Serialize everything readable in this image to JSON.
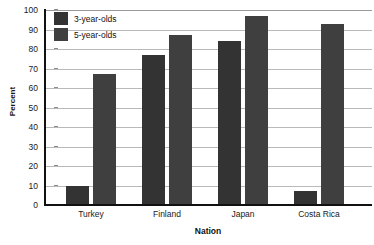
{
  "chart_data": {
    "type": "bar",
    "title": "",
    "subtitle": "",
    "xlabel": "Nation",
    "ylabel": "Percent",
    "categories": [
      "Turkey",
      "Finland",
      "Japan",
      "Costa Rica"
    ],
    "series": [
      {
        "name": "3-year-olds",
        "color": "#333333",
        "values": [
          10,
          77,
          84,
          7
        ]
      },
      {
        "name": "5-year-olds",
        "color": "#3f3f3f",
        "values": [
          67,
          87,
          97,
          93
        ]
      }
    ],
    "ylim": [
      0,
      100
    ],
    "ytick_step": 10,
    "yticks": [
      0,
      10,
      20,
      30,
      40,
      50,
      60,
      70,
      80,
      90,
      100
    ],
    "ytick_labels": [
      "0",
      "10",
      "20",
      "30",
      "40",
      "50",
      "60",
      "70",
      "80",
      "90",
      "100"
    ],
    "grid": true,
    "grid_axis": "y",
    "grid_color": "#b9b9b9",
    "axis_color": "#111111",
    "legend_position": "top-left",
    "background": "#ffffff"
  },
  "legend": {
    "entries": [
      {
        "label": "3-year-olds",
        "color": "#333333"
      },
      {
        "label": "5-year-olds",
        "color": "#3f3f3f"
      }
    ]
  },
  "axes": {
    "y_title": "Percent",
    "x_title": "Nation"
  }
}
